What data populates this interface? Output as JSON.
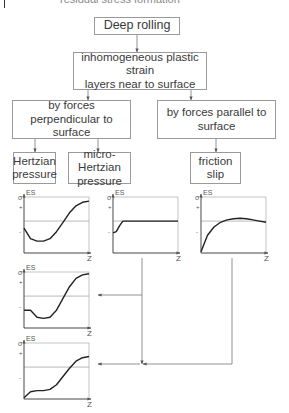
{
  "diagram": {
    "top_partial_text": "residual stress formation",
    "nodes": {
      "root": {
        "label": "Deep rolling"
      },
      "strain": {
        "line1": "inhomogeneous plastic strain",
        "line2": "layers near to surface"
      },
      "perpendicular": {
        "line1": "by forces perpendicular to",
        "line2": "surface"
      },
      "parallel": {
        "line1": "by forces parallel to",
        "line2": "surface"
      },
      "hertzian": {
        "line1": "Hertzian",
        "line2": "pressure"
      },
      "micro_hertzian": {
        "line1": "micro-Hertzian",
        "line2": "pressure"
      },
      "friction": {
        "line1": "friction",
        "line2": "slip"
      }
    },
    "colors": {
      "box_border": "#9a9a9a",
      "text": "#3a3a3a",
      "curve": "#222222",
      "axis": "#888888"
    }
  },
  "chart_data": [
    {
      "id": "hertzian",
      "type": "line",
      "title": "",
      "xlabel": "Z",
      "ylabel": "σ ES",
      "yticks": [
        "+",
        "-"
      ],
      "x": [
        0,
        0.1,
        0.2,
        0.3,
        0.4,
        0.5,
        0.6,
        0.7,
        0.8,
        0.9,
        1.0
      ],
      "values": [
        -0.3,
        -0.75,
        -0.85,
        -0.85,
        -0.75,
        -0.45,
        -0.05,
        0.35,
        0.65,
        0.8,
        0.85
      ]
    },
    {
      "id": "micro_hertzian",
      "type": "line",
      "title": "",
      "xlabel": "Z",
      "ylabel": "σ ES",
      "yticks": [
        "+",
        "-"
      ],
      "x": [
        0,
        0.05,
        0.1,
        0.15,
        0.2,
        0.3,
        0.5,
        0.7,
        1.0
      ],
      "values": [
        -0.5,
        -0.45,
        -0.2,
        0,
        0,
        0,
        0,
        0,
        0
      ]
    },
    {
      "id": "friction",
      "type": "line",
      "title": "",
      "xlabel": "Z",
      "ylabel": "σ ES",
      "yticks": [
        "+",
        "-"
      ],
      "x": [
        0,
        0.1,
        0.2,
        0.3,
        0.4,
        0.5,
        0.6,
        0.7,
        0.8,
        0.9,
        1.0
      ],
      "values": [
        -1.3,
        -0.6,
        -0.25,
        -0.05,
        0.05,
        0.1,
        0.12,
        0.1,
        0.05,
        0.0,
        -0.05
      ]
    },
    {
      "id": "hertzian_plus_micro",
      "type": "line",
      "title": "",
      "xlabel": "Z",
      "ylabel": "σ ES",
      "yticks": [
        "+",
        "-"
      ],
      "x": [
        0,
        0.1,
        0.2,
        0.3,
        0.4,
        0.5,
        0.6,
        0.7,
        0.8,
        0.9,
        1.0
      ],
      "values": [
        -0.6,
        -0.6,
        -0.9,
        -0.95,
        -0.9,
        -0.6,
        -0.1,
        0.4,
        0.75,
        0.9,
        0.95
      ]
    },
    {
      "id": "all_combined",
      "type": "line",
      "title": "",
      "xlabel": "Z",
      "ylabel": "σ ES",
      "yticks": [
        "+",
        "-"
      ],
      "x": [
        0,
        0.1,
        0.2,
        0.3,
        0.4,
        0.5,
        0.6,
        0.7,
        0.8,
        0.9,
        1.0
      ],
      "values": [
        -1.3,
        -1.05,
        -1.0,
        -1.0,
        -0.95,
        -0.75,
        -0.4,
        -0.05,
        0.25,
        0.4,
        0.45
      ]
    }
  ]
}
